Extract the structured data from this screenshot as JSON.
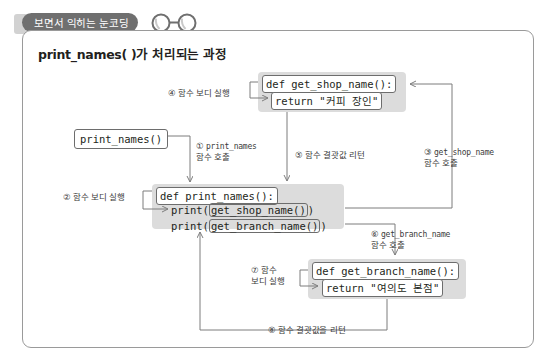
{
  "header": {
    "tab_label": "보면서 익히는 눈코딩",
    "glasses_icon": "glasses-icon"
  },
  "panel": {
    "title": "print_names( )가 처리되는 과정"
  },
  "entry_call": {
    "code": "print_names()"
  },
  "blocks": {
    "get_shop_name": {
      "def_line": "def get_shop_name():",
      "return_line": "return \"커피 장인\""
    },
    "print_names": {
      "def_line": "def print_names():",
      "call_1_prefix": "print(",
      "call_1_inner": "get_shop_name()",
      "call_1_suffix": ")",
      "call_2_prefix": "print(",
      "call_2_inner": "get_branch_name()",
      "call_2_suffix": ")"
    },
    "get_branch_name": {
      "def_line": "def get_branch_name():",
      "return_line": "return \"여의도 본점\""
    }
  },
  "steps": {
    "step1": {
      "marker": "①",
      "mono": "print_names",
      "text": "함수 호출"
    },
    "step2": {
      "marker": "②",
      "text": "함수 보디 실행"
    },
    "step3": {
      "marker": "③",
      "mono": "get_shop_name",
      "text": "함수 호출"
    },
    "step4": {
      "marker": "④",
      "text": "함수 보디 실행"
    },
    "step5": {
      "marker": "⑤",
      "text": "함수 결괏값 리턴"
    },
    "step6": {
      "marker": "⑥",
      "mono": "get_branch_name",
      "text": "함수 호출"
    },
    "step7": {
      "marker": "⑦",
      "text_line1": "함수",
      "text_line2": "보디 실행"
    },
    "step8": {
      "marker": "⑧",
      "text": "함수 결괏값을 리턴"
    }
  },
  "colors": {
    "tab_background": "#6f6f6f",
    "group_background": "#dcdcdc",
    "panel_border": "#9a9a9a",
    "code_border": "#6d6d6d",
    "wire": "#8c8c8c"
  }
}
